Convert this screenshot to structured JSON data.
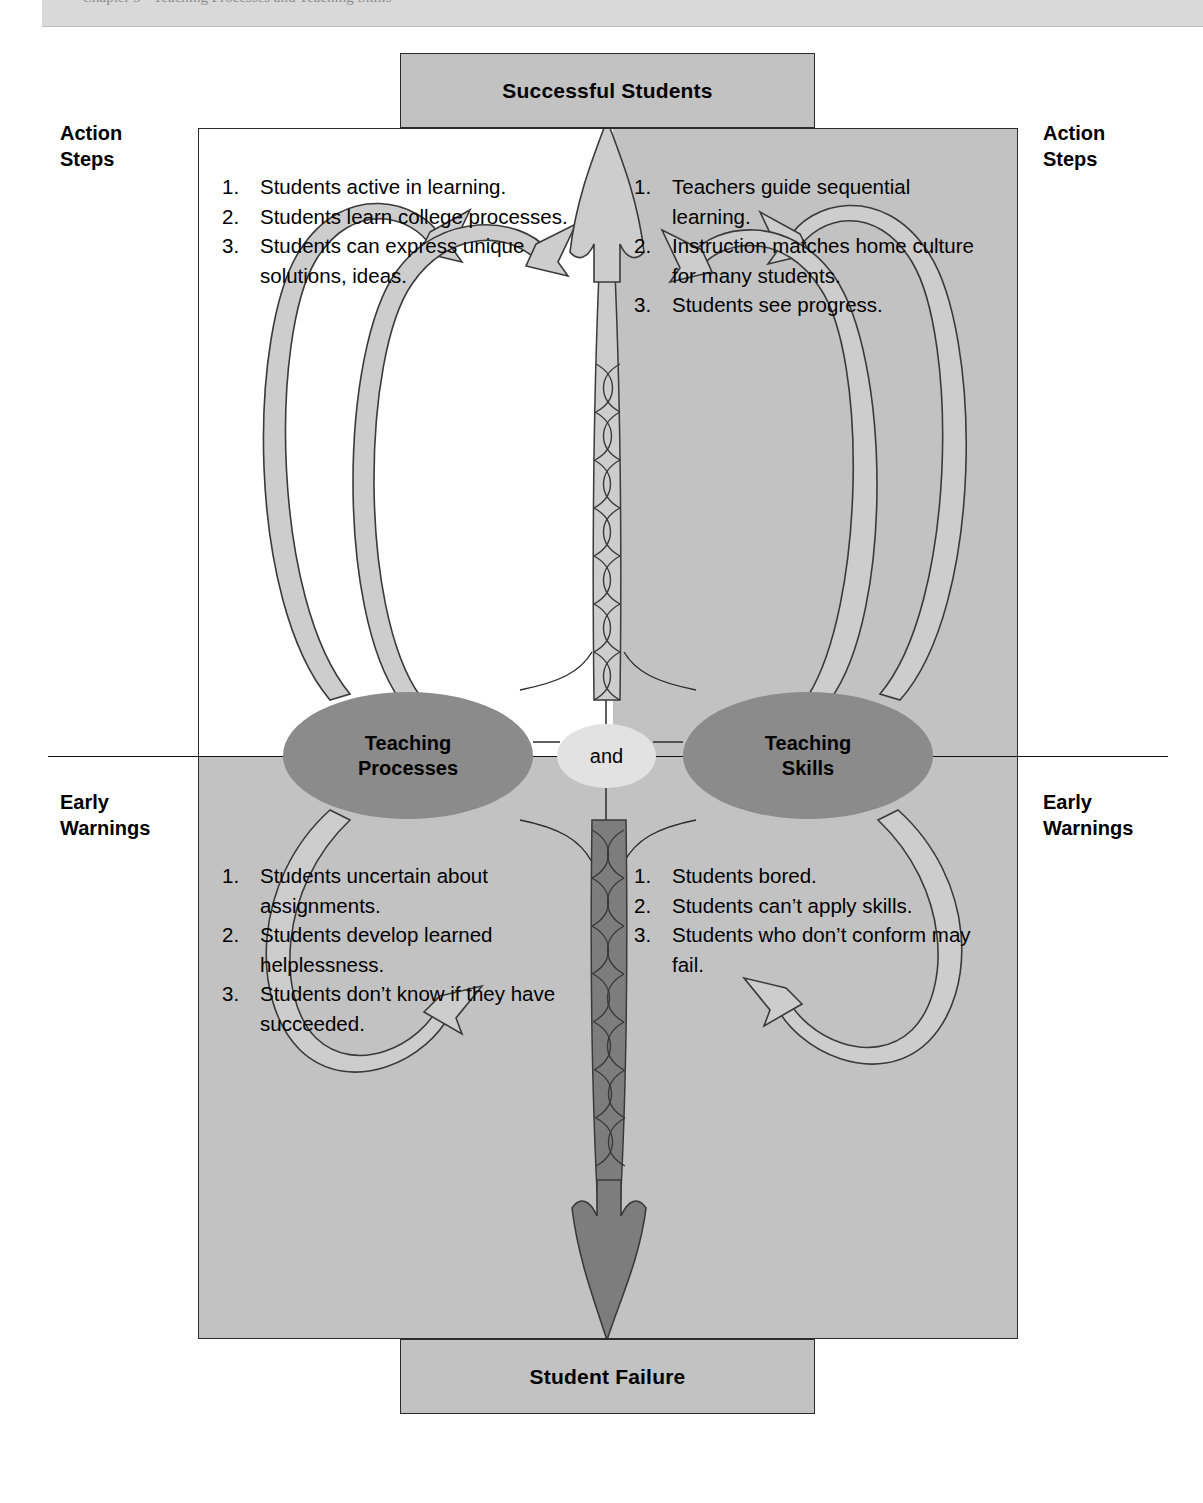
{
  "page": {
    "header_ghost_text": "Chapter 5  •  Teaching Processes and Teaching Skills",
    "width": 1203,
    "height": 1503
  },
  "colors": {
    "quadrant_shade": "#c2c2c2",
    "endbox_fill": "#c2c2c2",
    "node_fill": "#8b8b8b",
    "connector_fill": "#e2e2e2",
    "light_arrow": "#cdcdcd",
    "dark_arrow": "#7d7d7d",
    "outline": "#2b2b2b",
    "page_background": "#ffffff"
  },
  "endpoints": {
    "top": {
      "label": "Successful Students"
    },
    "bottom": {
      "label": "Student Failure"
    }
  },
  "side_labels": {
    "top_left": "Action\nSteps",
    "top_right": "Action\nSteps",
    "bottom_left": "Early\nWarnings",
    "bottom_right": "Early\nWarnings"
  },
  "nodes": {
    "left": {
      "label": "Teaching\nProcesses"
    },
    "right": {
      "label": "Teaching\nSkills"
    },
    "connector": {
      "label": "and"
    }
  },
  "quadrants": {
    "top_left": {
      "title": "Action Steps — Teaching Processes",
      "items": [
        {
          "num": "1.",
          "text": "Students active in learning."
        },
        {
          "num": "2.",
          "text": "Students learn college processes."
        },
        {
          "num": "3.",
          "text": "Students can express unique solutions, ideas."
        }
      ]
    },
    "top_right": {
      "title": "Action Steps — Teaching Skills",
      "items": [
        {
          "num": "1.",
          "text": "Teachers guide sequential learning."
        },
        {
          "num": "2.",
          "text": "Instruction matches home culture for many students."
        },
        {
          "num": "3.",
          "text": "Students see progress."
        }
      ]
    },
    "bottom_left": {
      "title": "Early Warnings — Teaching Processes",
      "items": [
        {
          "num": "1.",
          "text": "Students uncertain about assignments."
        },
        {
          "num": "2.",
          "text": "Students develop learned helplessness."
        },
        {
          "num": "3.",
          "text": "Students don’t know if they have succeeded."
        }
      ]
    },
    "bottom_right": {
      "title": "Early Warnings — Teaching Skills",
      "items": [
        {
          "num": "1.",
          "text": "Students bored."
        },
        {
          "num": "2.",
          "text": "Students can’t apply skills."
        },
        {
          "num": "3.",
          "text": "Students who don’t conform may fail."
        }
      ]
    }
  },
  "arrows": {
    "up_center": {
      "name": "twisted-rope-up-arrow",
      "direction": "up",
      "target": "Successful Students"
    },
    "down_center": {
      "name": "twisted-rope-down-arrow",
      "direction": "down",
      "target": "Student Failure"
    },
    "loops": [
      {
        "name": "left-upper-loop",
        "from": "Teaching Processes",
        "to": "Action Steps (left)"
      },
      {
        "name": "left-lower-loop",
        "from": "Teaching Processes",
        "to": "Early Warnings (left)"
      },
      {
        "name": "right-upper-loop",
        "from": "Teaching Skills",
        "to": "Action Steps (right)"
      },
      {
        "name": "right-lower-loop",
        "from": "Teaching Skills",
        "to": "Early Warnings (right)"
      }
    ]
  }
}
